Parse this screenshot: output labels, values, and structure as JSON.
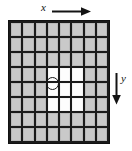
{
  "figure": {
    "type": "grid-diagram",
    "title": "",
    "axes": {
      "x": {
        "label": "x",
        "direction": "right",
        "arrow_icon": "arrow-right-icon"
      },
      "y": {
        "label": "y",
        "direction": "down",
        "arrow_icon": "arrow-down-icon"
      }
    },
    "grid": {
      "columns": 8,
      "rows": 8,
      "cell_fill_color": "#c9c9c9",
      "highlight_fill_color": "#fdfdfd",
      "gridline_color": "#1a1a1a",
      "highlighted_region": {
        "description": "3x3 block of white cells",
        "col_start": 3,
        "col_end": 5,
        "row_start": 4,
        "row_end": 6
      },
      "cells": [
        [
          "gray",
          "gray",
          "gray",
          "gray",
          "gray",
          "gray",
          "gray",
          "gray"
        ],
        [
          "gray",
          "gray",
          "gray",
          "gray",
          "gray",
          "gray",
          "gray",
          "gray"
        ],
        [
          "gray",
          "gray",
          "gray",
          "gray",
          "gray",
          "gray",
          "gray",
          "gray"
        ],
        [
          "gray",
          "gray",
          "gray",
          "white",
          "white",
          "white",
          "gray",
          "gray"
        ],
        [
          "gray",
          "gray",
          "gray",
          "white",
          "white",
          "white",
          "gray",
          "gray"
        ],
        [
          "gray",
          "gray",
          "gray",
          "white",
          "white",
          "white",
          "gray",
          "gray"
        ],
        [
          "gray",
          "gray",
          "gray",
          "gray",
          "gray",
          "gray",
          "gray",
          "gray"
        ],
        [
          "gray",
          "gray",
          "gray",
          "gray",
          "gray",
          "gray",
          "gray",
          "gray"
        ]
      ]
    },
    "marker": {
      "shape": "circle",
      "outline_color": "#171717",
      "fill": "none",
      "label": ""
    }
  }
}
